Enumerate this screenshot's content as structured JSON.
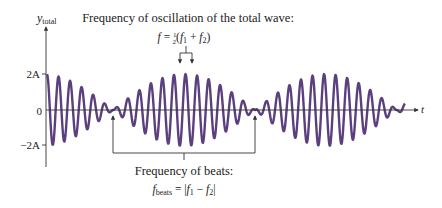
{
  "diagram": {
    "y_axis": {
      "label_main": "y",
      "label_sub": "total",
      "ticks": [
        {
          "label": "2A",
          "value": 2
        },
        {
          "label": "0",
          "value": 0
        },
        {
          "label": "−2A",
          "value": -2
        }
      ]
    },
    "x_axis": {
      "label": "t"
    },
    "top_annotation": {
      "line1": "Frequency of oscillation of the total wave:",
      "formula_lhs": "f",
      "formula_eq": " = ",
      "frac_num": "1",
      "frac_den": "2",
      "formula_rest_open": "(",
      "f1": "f",
      "f1_sub": "1",
      "plus": " + ",
      "f2": "f",
      "f2_sub": "2",
      "formula_rest_close": ")"
    },
    "bottom_annotation": {
      "line1": "Frequency of beats:",
      "lhs": "f",
      "lhs_sub": "beats",
      "eq": " = |",
      "f1": "f",
      "f1_sub": "1",
      "minus": " − ",
      "f2": "f",
      "f2_sub": "2",
      "close": "|"
    },
    "wave": {
      "color": "#5b3f7e",
      "max_amplitude": 2,
      "carrier_cycles_per_beat": 12.3,
      "beats_shown": 2.5
    },
    "axis_color": "#333333"
  }
}
